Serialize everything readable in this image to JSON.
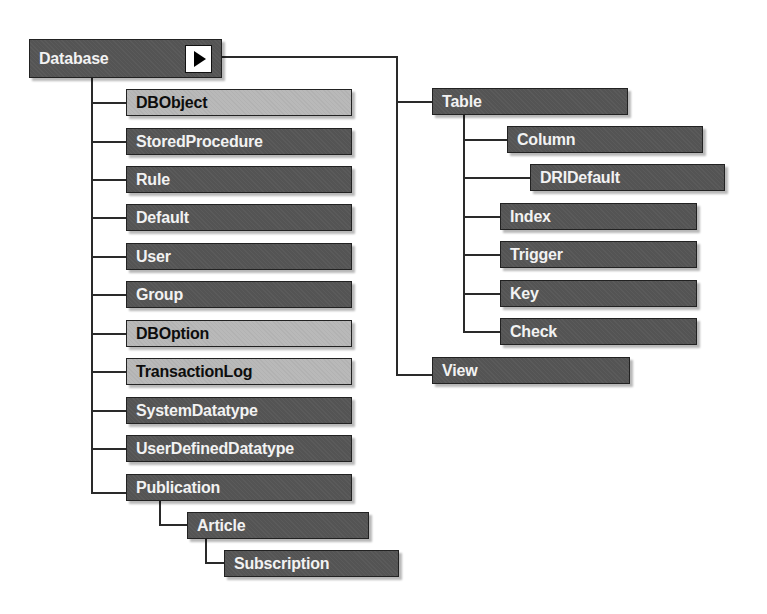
{
  "diagram": {
    "root": {
      "label": "Database",
      "expand_icon": "play-arrow-icon"
    },
    "database_children": [
      {
        "label": "DBObject",
        "style": "light"
      },
      {
        "label": "StoredProcedure",
        "style": "dark"
      },
      {
        "label": "Rule",
        "style": "dark"
      },
      {
        "label": "Default",
        "style": "dark"
      },
      {
        "label": "User",
        "style": "dark"
      },
      {
        "label": "Group",
        "style": "dark"
      },
      {
        "label": "DBOption",
        "style": "light"
      },
      {
        "label": "TransactionLog",
        "style": "light"
      },
      {
        "label": "SystemDatatype",
        "style": "dark"
      },
      {
        "label": "UserDefinedDatatype",
        "style": "dark"
      },
      {
        "label": "Publication",
        "style": "dark"
      }
    ],
    "publication_children": [
      {
        "label": "Article",
        "style": "dark"
      }
    ],
    "article_children": [
      {
        "label": "Subscription",
        "style": "dark"
      }
    ],
    "collection_branch": [
      {
        "label": "Table",
        "style": "dark"
      },
      {
        "label": "View",
        "style": "dark"
      }
    ],
    "table_children": [
      {
        "label": "Column",
        "style": "dark"
      },
      {
        "label": "DRIDefault",
        "style": "dark"
      },
      {
        "label": "Index",
        "style": "dark"
      },
      {
        "label": "Trigger",
        "style": "dark"
      },
      {
        "label": "Key",
        "style": "dark"
      },
      {
        "label": "Check",
        "style": "dark"
      }
    ]
  }
}
